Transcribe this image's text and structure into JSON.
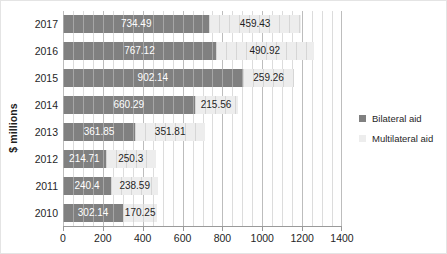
{
  "chart_data": {
    "type": "bar",
    "orientation": "horizontal",
    "stacked": true,
    "title": "",
    "xlabel": "",
    "ylabel": "$ millions",
    "xlim": [
      0,
      1400
    ],
    "xticks": [
      0,
      200,
      400,
      600,
      800,
      1000,
      1200,
      1400
    ],
    "xtick_labels": [
      "0",
      "200",
      "400",
      "600",
      "800",
      "1000",
      "1200",
      "1400"
    ],
    "minor_tick_step": 50,
    "grid": true,
    "legend_position": "right",
    "categories": [
      "2017",
      "2016",
      "2015",
      "2014",
      "2013",
      "2012",
      "2011",
      "2010"
    ],
    "series": [
      {
        "name": "Bilateral aid",
        "color": "#808080",
        "values": [
          734.49,
          767.12,
          902.14,
          660.29,
          361.85,
          214.71,
          240.4,
          302.14
        ],
        "labels": [
          "734.49",
          "767.12",
          "902.14",
          "660.29",
          "361.85",
          "214.71",
          "240.4",
          "302.14"
        ]
      },
      {
        "name": "Multilateral aid",
        "color": "#ededed",
        "values": [
          459.43,
          490.92,
          259.26,
          215.56,
          351.81,
          250.3,
          238.59,
          170.25
        ],
        "labels": [
          "459.43",
          "490.92",
          "259.26",
          "215.56",
          "351.81",
          "250.3",
          "238.59",
          "170.25"
        ]
      }
    ]
  },
  "legend": {
    "entries": [
      {
        "label": "Bilateral aid",
        "color": "#808080"
      },
      {
        "label": "Multilateral aid",
        "color": "#ededed"
      }
    ]
  }
}
